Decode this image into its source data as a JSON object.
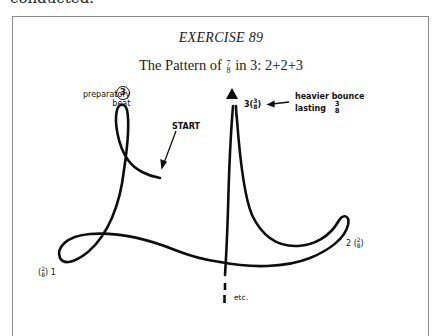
{
  "page": {
    "previous_text_fragment": "conducted."
  },
  "exercise": {
    "title": "EXERCISE 89",
    "heading_prefix": "The Pattern of",
    "heading_frac_num": "7",
    "heading_frac_den": "8",
    "heading_suffix": "in 3: 2+2+3"
  },
  "diagram": {
    "labels": {
      "preparatory_line1": "preparatory",
      "preparatory_line2": "beat",
      "preparatory_number": "3",
      "start": "START",
      "beat3_number": "3",
      "beat3_frac_num": "3",
      "beat3_frac_den": "8",
      "heavier_line1": "heavier bounce",
      "heavier_line2": "lasting",
      "heavier_frac_num": "3",
      "heavier_frac_den": "8",
      "beat1_number": "1",
      "beat1_frac_num": "2",
      "beat1_frac_den": "8",
      "beat2_number": "2",
      "beat2_frac_num": "2",
      "beat2_frac_den": "8",
      "etc": "etc."
    },
    "beats": [
      {
        "beat": 1,
        "duration": "2/8",
        "position": "bottom-left"
      },
      {
        "beat": 2,
        "duration": "2/8",
        "position": "right"
      },
      {
        "beat": 3,
        "duration": "3/8",
        "position": "top-center",
        "note": "heavier bounce lasting 3/8"
      }
    ],
    "colors": {
      "stroke": "#0d0d0d",
      "frame": "#8a8a8a"
    }
  }
}
